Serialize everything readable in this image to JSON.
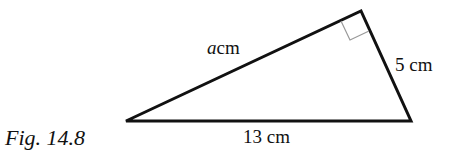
{
  "figure": {
    "caption": "Fig. 14.8",
    "shape": "right triangle",
    "labels": {
      "hypotenuse": "13 cm",
      "short_leg": "5 cm",
      "long_leg_var": "a",
      "long_leg_unit": "cm"
    },
    "right_angle_marker": true,
    "colors": {
      "stroke": "#111111",
      "marker": "#999999",
      "background": "#ffffff"
    }
  }
}
